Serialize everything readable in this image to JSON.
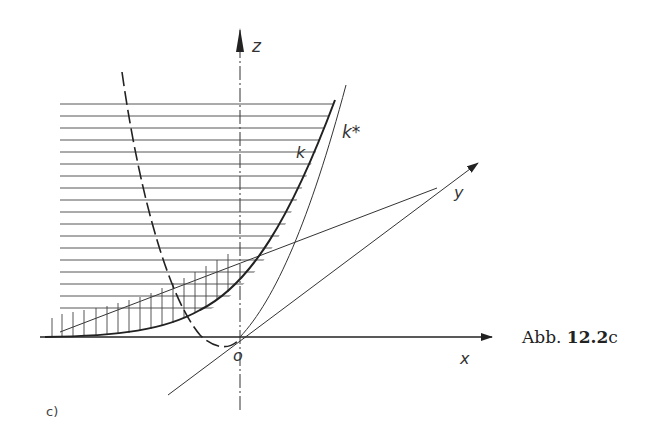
{
  "figure": {
    "caption_prefix": "Abb.",
    "caption_number": "12.2",
    "caption_suffix": "c",
    "subfigure_label": "c)"
  },
  "axes": {
    "x_label": "x",
    "y_label": "y",
    "z_label": "z",
    "origin_label": "o"
  },
  "curves": {
    "k_label": "k",
    "k_star_label": "k*"
  },
  "colors": {
    "ink": "#222222",
    "background": "#ffffff"
  }
}
